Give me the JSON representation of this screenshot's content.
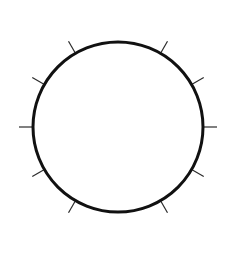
{
  "figure": {
    "background_color": "#ffffff",
    "width": 238,
    "height": 255
  },
  "chart_data": {
    "type": "scatter",
    "subtitle": "",
    "xlabel": "",
    "ylabel": "",
    "grid": false,
    "legend": null,
    "annotations": [],
    "tick_labels": [],
    "circle": {
      "center_x": 118,
      "center_y": 127,
      "radius": 85,
      "stroke_color": "#111111",
      "stroke_width": 3,
      "fill": "none"
    },
    "ticks": {
      "count": 10,
      "stroke_color": "#2b2b2b",
      "stroke_width": 1.2,
      "length": 14,
      "direction": "outward",
      "missing_angles_deg": [
        0,
        180
      ],
      "angles_deg_clockwise_from_top": [
        30,
        60,
        90,
        120,
        150,
        210,
        240,
        270,
        300,
        330
      ],
      "items": [
        {
          "angle_deg": 30,
          "label": ""
        },
        {
          "angle_deg": 60,
          "label": ""
        },
        {
          "angle_deg": 90,
          "label": ""
        },
        {
          "angle_deg": 120,
          "label": ""
        },
        {
          "angle_deg": 150,
          "label": ""
        },
        {
          "angle_deg": 210,
          "label": ""
        },
        {
          "angle_deg": 240,
          "label": ""
        },
        {
          "angle_deg": 270,
          "label": ""
        },
        {
          "angle_deg": 300,
          "label": ""
        },
        {
          "angle_deg": 330,
          "label": ""
        }
      ]
    }
  }
}
